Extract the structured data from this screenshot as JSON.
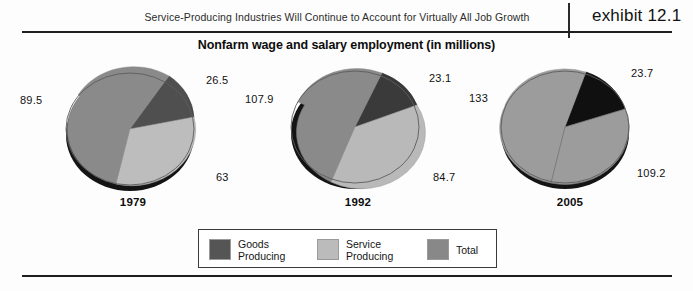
{
  "header": {
    "caption": "Service-Producing Industries Will Continue to Account for Virtually All Job Growth",
    "exhibit_label": "exhibit 12.1"
  },
  "subtitle": "Nonfarm wage and salary employment (in millions)",
  "legend": {
    "items": [
      {
        "label": "Goods\nProducing",
        "color": "#555555",
        "name": "goods-producing"
      },
      {
        "label": "Service\nProducing",
        "color": "#bbbbbb",
        "name": "service-producing"
      },
      {
        "label": "Total",
        "color": "#888888",
        "name": "total"
      }
    ]
  },
  "colors": {
    "goods_1979": "#4f4f4f",
    "goods_1992": "#3a3a3a",
    "goods_2005": "#101010",
    "service_1979": "#bdbdbd",
    "service_1992": "#b9b9b9",
    "service_2005": "#9c9c9c",
    "total_1979": "#8a8a8a",
    "total_1992": "#8a8a8a",
    "total_2005": "#9c9c9c",
    "rule": "#1e1e1e"
  },
  "chart_data": {
    "type": "pie",
    "title": "Nonfarm wage and salary employment (in millions)",
    "subtitle": "Service-Producing Industries Will Continue to Account for Virtually All Job Growth",
    "units": "millions of jobs",
    "legend_position": "bottom",
    "series_names": [
      "Goods Producing",
      "Service Producing",
      "Total"
    ],
    "charts": [
      {
        "year": "1979",
        "slices": [
          {
            "name": "Goods Producing",
            "value": 26.5,
            "label": "26.5"
          },
          {
            "name": "Service Producing",
            "value": 63,
            "label": "63"
          },
          {
            "name": "Total",
            "value": 89.5,
            "label": "89.5"
          }
        ]
      },
      {
        "year": "1992",
        "slices": [
          {
            "name": "Goods Producing",
            "value": 23.1,
            "label": "23.1"
          },
          {
            "name": "Service Producing",
            "value": 84.7,
            "label": "84.7"
          },
          {
            "name": "Total",
            "value": 107.9,
            "label": "107.9"
          }
        ]
      },
      {
        "year": "2005",
        "slices": [
          {
            "name": "Goods Producing",
            "value": 23.7,
            "label": "23.7"
          },
          {
            "name": "Service Producing",
            "value": 109.2,
            "label": "109.2"
          },
          {
            "name": "Total",
            "value": 133,
            "label": "133"
          }
        ]
      }
    ]
  },
  "pies": [
    {
      "year": "1979",
      "left": 18,
      "labels": {
        "total": {
          "text": "89.5",
          "x": 2,
          "y": 39
        },
        "goods": {
          "text": "26.5",
          "x": 188,
          "y": 19
        },
        "service": {
          "text": "63",
          "x": 198,
          "y": 116
        }
      }
    },
    {
      "year": "1992",
      "left": 243,
      "labels": {
        "total": {
          "text": "107.9",
          "x": 2,
          "y": 38
        },
        "goods": {
          "text": "23.1",
          "x": 186,
          "y": 17
        },
        "service": {
          "text": "84.7",
          "x": 190,
          "y": 116
        }
      }
    },
    {
      "year": "2005",
      "left": 455,
      "labels": {
        "total": {
          "text": "133",
          "x": 14,
          "y": 37
        },
        "goods": {
          "text": "23.7",
          "x": 176,
          "y": 12
        },
        "service": {
          "text": "109.2",
          "x": 182,
          "y": 112
        }
      }
    }
  ]
}
